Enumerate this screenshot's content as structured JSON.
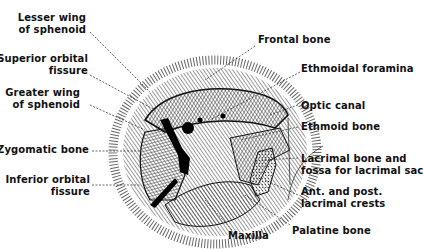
{
  "figure": {
    "labels_left": [
      {
        "id": "lesser-wing",
        "lines": [
          "Lesser wing",
          "of sphenoid"
        ]
      },
      {
        "id": "superior-orbital-fissure",
        "lines": [
          "Superior orbital",
          "fissure"
        ]
      },
      {
        "id": "greater-wing",
        "lines": [
          "Greater wing",
          "of sphenoid"
        ]
      },
      {
        "id": "zygomatic-bone",
        "lines": [
          "Zygomatic bone"
        ]
      },
      {
        "id": "inferior-orbital-fissure",
        "lines": [
          "Inferior orbital",
          "fissure"
        ]
      }
    ],
    "labels_right": [
      {
        "id": "frontal-bone",
        "lines": [
          "Frontal bone"
        ]
      },
      {
        "id": "ethmoidal-foramina",
        "lines": [
          "Ethmoidal foramina"
        ]
      },
      {
        "id": "optic-canal",
        "lines": [
          "Optic canal"
        ]
      },
      {
        "id": "ethmoid-bone",
        "lines": [
          "Ethmoid bone"
        ]
      },
      {
        "id": "lacrimal-bone",
        "lines": [
          "Lacrimal bone and",
          "fossa for lacrimal sac"
        ]
      },
      {
        "id": "lacrimal-crests",
        "lines": [
          "Ant. and post.",
          "lacrimal crests"
        ]
      },
      {
        "id": "palatine-bone",
        "lines": [
          "Palatine bone"
        ]
      }
    ],
    "labels_bottom": [
      {
        "id": "maxilla",
        "lines": [
          "Maxilla"
        ]
      }
    ]
  }
}
